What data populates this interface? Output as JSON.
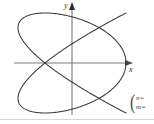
{
  "figure": {
    "kind": "lissajous-figure",
    "width": 154,
    "height": 124,
    "background_color": "#ffffff",
    "curve_color": "#3a3a3a",
    "axis_color": "#7a7a7a",
    "rule_color": "#d8d8d8"
  },
  "axes": {
    "x_label": "x",
    "y_label": "y",
    "x_axis": {
      "y_px": 63,
      "x_start_px": 14,
      "x_end_px": 130,
      "arrow": "right"
    },
    "y_axis": {
      "x_px": 72,
      "y_start_px": 115,
      "y_end_px": 3,
      "arrow": "up"
    }
  },
  "annotation": {
    "open_paren": "(",
    "line1": "n=",
    "line2": "m="
  },
  "chart_data": {
    "type": "line",
    "title": "",
    "xlabel": "x",
    "ylabel": "y",
    "grid": false,
    "legend": false,
    "curve_type": "lissajous",
    "parametric": {
      "x": "A*sin(n*t + d)",
      "y": "B*sin(m*t)",
      "n": 4,
      "m": 3,
      "delta": 1.5707963,
      "A": 54,
      "B": 50,
      "t_range": [
        0,
        6.2831853
      ]
    },
    "horizontal_lobes": 4,
    "vertical_lobes": 3,
    "bounding_box_px": {
      "left": 19,
      "right": 127,
      "top": 13,
      "bottom": 112
    },
    "center_px": {
      "x": 72,
      "y": 63
    },
    "xlim": [
      -54,
      54
    ],
    "ylim": [
      -50,
      50
    ]
  }
}
